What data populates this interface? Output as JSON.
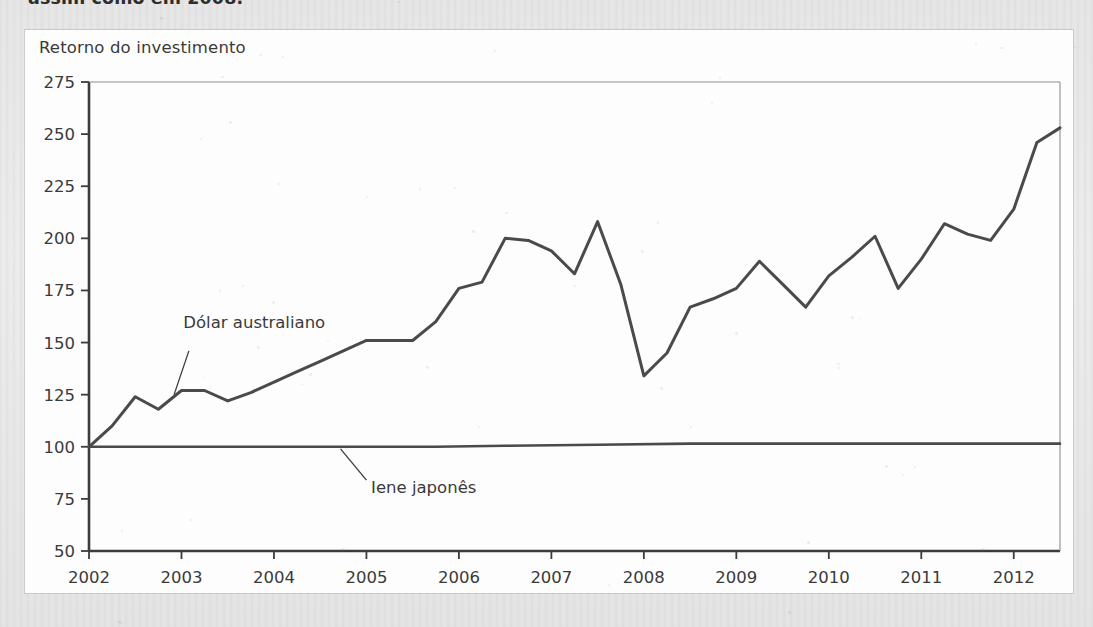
{
  "page": {
    "cut_heading": "assim como em 2008.",
    "background_color": "#e9e9e9",
    "panel_color": "#fdfdfd"
  },
  "figure": {
    "title": "Retorno do investimento"
  },
  "chart_data": {
    "type": "line",
    "title": "Retorno do investimento",
    "xlabel": "",
    "ylabel": "",
    "xlim": [
      2002,
      2012.5
    ],
    "ylim": [
      50,
      275
    ],
    "grid": false,
    "legend": "inline-annotations",
    "line_color": "#4a4a4a",
    "y_ticks": [
      50,
      75,
      100,
      125,
      150,
      175,
      200,
      225,
      250,
      275
    ],
    "x_ticks": [
      2002,
      2003,
      2004,
      2005,
      2006,
      2007,
      2008,
      2009,
      2010,
      2011,
      2012
    ],
    "annotations": [
      {
        "text": "Dólar australiano",
        "series": "Dólar australiano",
        "x": 2003.15,
        "y": 127
      },
      {
        "text": "Iene japonês",
        "series": "Iene japonês",
        "x": 2004.85,
        "y": 100
      }
    ],
    "series": [
      {
        "name": "Dólar australiano",
        "x": [
          2002.0,
          2002.25,
          2002.5,
          2002.75,
          2003.0,
          2003.25,
          2003.5,
          2003.75,
          2004.0,
          2004.25,
          2004.5,
          2004.75,
          2005.0,
          2005.25,
          2005.5,
          2005.75,
          2006.0,
          2006.25,
          2006.5,
          2006.75,
          2007.0,
          2007.25,
          2007.5,
          2007.75,
          2008.0,
          2008.25,
          2008.5,
          2008.75,
          2009.0,
          2009.25,
          2009.5,
          2009.75,
          2010.0,
          2010.25,
          2010.5,
          2010.75,
          2011.0,
          2011.25,
          2011.5,
          2011.75,
          2012.0,
          2012.25,
          2012.5
        ],
        "values": [
          100,
          110,
          124,
          118,
          127,
          127,
          122,
          126,
          131,
          136,
          141,
          146,
          151,
          151,
          151,
          160,
          176,
          179,
          200,
          199,
          194,
          183,
          208,
          178,
          134,
          145,
          167,
          171,
          176,
          189,
          178,
          167,
          182,
          191,
          201,
          176,
          190,
          207,
          202,
          199,
          214,
          246,
          253
        ]
      },
      {
        "name": "Iene japonês",
        "x": [
          2002.0,
          2003.0,
          2004.0,
          2005.0,
          2005.75,
          2006.5,
          2007.5,
          2008.5,
          2010.0,
          2012.5
        ],
        "values": [
          100,
          100,
          100,
          100,
          100,
          100.5,
          101,
          101.5,
          101.5,
          101.5
        ]
      }
    ]
  }
}
